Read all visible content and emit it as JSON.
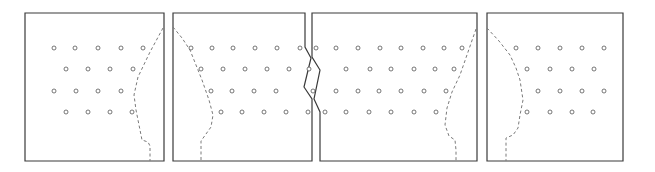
{
  "diagram": {
    "colors": {
      "outline": "#3a3a3a",
      "dashed_curve": "#7a7a7a",
      "dot_stroke": "#555555",
      "background": "#ffffff"
    },
    "dot_radius": 2,
    "panels": [
      {
        "id": "panel-1",
        "outline": [
          [
            25,
            13
          ],
          [
            164,
            13
          ],
          [
            164,
            161
          ],
          [
            25,
            161
          ]
        ],
        "curve": [
          [
            163,
            28
          ],
          [
            150,
            52
          ],
          [
            138,
            77
          ],
          [
            134,
            95
          ],
          [
            136,
            110
          ],
          [
            139,
            125
          ],
          [
            142,
            140
          ],
          [
            148,
            142
          ],
          [
            150,
            146
          ],
          [
            150,
            161
          ]
        ],
        "rows": [
          {
            "y": 48,
            "x": [
              54,
              75,
              98,
              121,
              143
            ]
          },
          {
            "y": 69,
            "x": [
              66,
              88,
              110,
              133
            ]
          },
          {
            "y": 91,
            "x": [
              54,
              76,
              98,
              121
            ]
          },
          {
            "y": 112,
            "x": [
              66,
              88,
              110,
              132
            ]
          }
        ]
      },
      {
        "id": "panel-2",
        "outline": [
          [
            173,
            13
          ],
          [
            305,
            13
          ],
          [
            305,
            47
          ],
          [
            311,
            58
          ],
          [
            304,
            87
          ],
          [
            312,
            99
          ],
          [
            312,
            161
          ],
          [
            173,
            161
          ]
        ],
        "curve": [
          [
            173,
            27
          ],
          [
            182,
            38
          ],
          [
            190,
            50
          ],
          [
            196,
            65
          ],
          [
            202,
            80
          ],
          [
            209,
            100
          ],
          [
            213,
            115
          ],
          [
            211,
            127
          ],
          [
            206,
            134
          ],
          [
            201,
            141
          ],
          [
            201,
            150
          ],
          [
            201,
            161
          ]
        ],
        "rows": [
          {
            "y": 48,
            "x": [
              191,
              212,
              233,
              255,
              277,
              300
            ]
          },
          {
            "y": 69,
            "x": [
              201,
              223,
              245,
              267,
              289,
              309
            ]
          },
          {
            "y": 91,
            "x": [
              211,
              232,
              254,
              276
            ]
          },
          {
            "y": 112,
            "x": [
              221,
              242,
              264,
              286,
              308
            ]
          }
        ]
      },
      {
        "id": "panel-3",
        "outline": [
          [
            312,
            13
          ],
          [
            477,
            13
          ],
          [
            477,
            161
          ],
          [
            320,
            161
          ],
          [
            320,
            112
          ],
          [
            314,
            99
          ],
          [
            320,
            70
          ],
          [
            312,
            57
          ]
        ],
        "curve": [
          [
            476,
            29
          ],
          [
            468,
            52
          ],
          [
            460,
            75
          ],
          [
            452,
            92
          ],
          [
            447,
            108
          ],
          [
            445,
            125
          ],
          [
            449,
            136
          ],
          [
            455,
            140
          ],
          [
            456,
            150
          ],
          [
            456,
            161
          ]
        ],
        "rows": [
          {
            "y": 48,
            "x": [
              316,
              336,
              358,
              380,
              401,
              423,
              444,
              462
            ]
          },
          {
            "y": 69,
            "x": [
              346,
              370,
              391,
              414,
              435,
              454
            ]
          },
          {
            "y": 91,
            "x": [
              313,
              336,
              358,
              379,
              401,
              424,
              446
            ]
          },
          {
            "y": 112,
            "x": [
              325,
              346,
              369,
              391,
              414,
              436
            ]
          }
        ]
      },
      {
        "id": "panel-4",
        "outline": [
          [
            487,
            13
          ],
          [
            623,
            13
          ],
          [
            623,
            161
          ],
          [
            487,
            161
          ]
        ],
        "curve": [
          [
            487,
            28
          ],
          [
            499,
            41
          ],
          [
            510,
            55
          ],
          [
            516,
            68
          ],
          [
            520,
            80
          ],
          [
            523,
            100
          ],
          [
            520,
            115
          ],
          [
            518,
            128
          ],
          [
            513,
            135
          ],
          [
            506,
            138
          ],
          [
            506,
            150
          ],
          [
            506,
            161
          ]
        ],
        "rows": [
          {
            "y": 48,
            "x": [
              516,
              538,
              560,
              582,
              604
            ]
          },
          {
            "y": 69,
            "x": [
              527,
              550,
              572,
              594
            ]
          },
          {
            "y": 91,
            "x": [
              538,
              560,
              582,
              604
            ]
          },
          {
            "y": 112,
            "x": [
              527,
              550,
              572,
              593
            ]
          }
        ]
      }
    ]
  }
}
